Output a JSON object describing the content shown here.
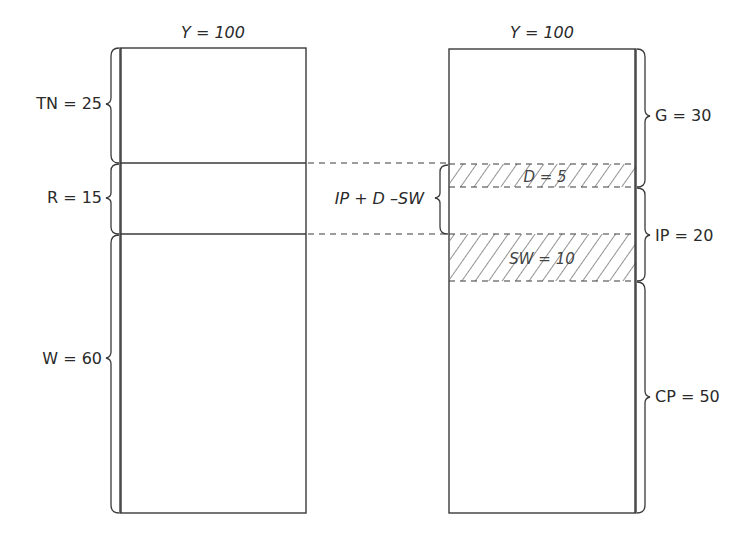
{
  "diagram": {
    "left_bar": {
      "title": "Y = 100",
      "segments": [
        {
          "label": "TN = 25",
          "name": "TN",
          "value": 25
        },
        {
          "label": "R = 15",
          "name": "R",
          "value": 15
        },
        {
          "label": "W = 60",
          "name": "W",
          "value": 60
        }
      ]
    },
    "right_bar": {
      "title": "Y = 100",
      "segments": [
        {
          "label": "G = 30",
          "name": "G",
          "value": 30
        },
        {
          "label": "IP = 20",
          "name": "IP",
          "value": 20
        },
        {
          "label": "CP = 50",
          "name": "CP",
          "value": 50
        }
      ],
      "hatched": [
        {
          "label": "D = 5",
          "name": "D",
          "value": 5
        },
        {
          "label": "SW = 10",
          "name": "SW",
          "value": 10
        }
      ]
    },
    "middle_label": "IP + D –SW",
    "colors": {
      "line": "#3a3a3a",
      "text": "#2a2a2a",
      "background": "#ffffff"
    }
  }
}
